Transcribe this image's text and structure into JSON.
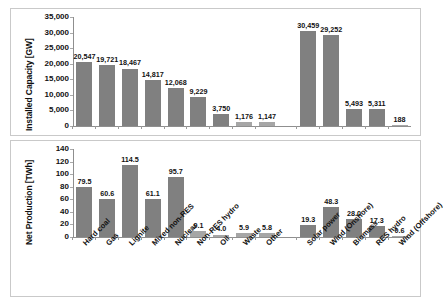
{
  "chart_data": [
    {
      "type": "bar",
      "title": "",
      "xlabel": "",
      "ylabel": "Installed Capacity [GW]",
      "ylim": [
        0,
        35000
      ],
      "ytick_labels": [
        "35,000",
        "30,000",
        "25,000",
        "20,000",
        "15,000",
        "10,000",
        "5,000",
        "0"
      ],
      "ytick_values": [
        35000,
        30000,
        25000,
        20000,
        15000,
        10000,
        5000,
        0
      ],
      "grid": false,
      "legend": "none",
      "categories": [
        "Hard coal",
        "Gas",
        "Lignite",
        "Mixed non-RES",
        "Nuclear",
        "Non-RES hydro",
        "Oil",
        "Waste",
        "Other",
        "Solar power",
        "Wind (Onshore)",
        "Biomass",
        "RES hydro",
        "Wind (Offshore)"
      ],
      "values": [
        20547,
        19721,
        18467,
        14817,
        12068,
        9229,
        3750,
        1176,
        1147,
        30459,
        29252,
        5493,
        5311,
        188
      ],
      "value_labels": [
        "20,547",
        "19,721",
        "18,467",
        "14,817",
        "12,068",
        "9,229",
        "3,750",
        "1,176",
        "1,147",
        "30,459",
        "29,252",
        "5,493",
        "5,311",
        "188"
      ]
    },
    {
      "type": "bar",
      "title": "",
      "xlabel": "",
      "ylabel": "Net Production [TWh]",
      "ylim": [
        0,
        140
      ],
      "ytick_labels": [
        "140",
        "120",
        "100",
        "80",
        "60",
        "40",
        "20",
        "0"
      ],
      "ytick_values": [
        140,
        120,
        100,
        80,
        60,
        40,
        20,
        0
      ],
      "grid": false,
      "legend": "none",
      "categories": [
        "Hard coal",
        "Gas",
        "Lignite",
        "Mixed non-RES",
        "Nuclear",
        "Non-RES hydro",
        "Oil",
        "Waste",
        "Other",
        "Solar power",
        "Wind (Onshore)",
        "Biomass",
        "RES hydro",
        "Wind (Offshore)"
      ],
      "values": [
        79.5,
        60.6,
        114.5,
        61.1,
        95.7,
        9.1,
        4.0,
        5.9,
        5.8,
        19.3,
        48.3,
        28.0,
        17.3,
        0.6
      ],
      "value_labels": [
        "79.5",
        "60.6",
        "114.5",
        "61.1",
        "95.7",
        "9.1",
        "4.0",
        "5.9",
        "5.8",
        "19.3",
        "48.3",
        "28.0",
        "17.3",
        "0.6"
      ]
    }
  ]
}
